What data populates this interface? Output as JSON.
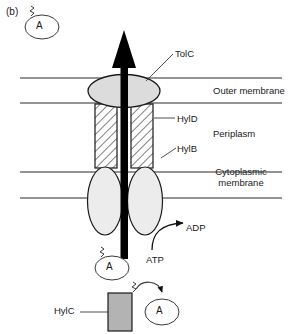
{
  "figure": {
    "panel_letter": "(b)",
    "title_implicit": "Type I secretion system (haemolysin HlyA export)",
    "background_color": "#ffffff",
    "line_color": "#1a1a1a"
  },
  "labels": {
    "tolc": "TolC",
    "hyld": "HylD",
    "hylb": "HylB",
    "hylc": "HylC",
    "outer_membrane": "Outer membrane",
    "periplasm": "Periplasm",
    "cytoplasmic_membrane": "Cytoplasmic membrane",
    "adp": "ADP",
    "atp": "ATP",
    "substrate_letter": "A"
  },
  "components": {
    "tolc": {
      "name": "TolC",
      "shape": "ellipse",
      "fill": "#dcdcdc",
      "stroke": "#1a1a1a",
      "cx": 124,
      "cy": 91,
      "rx": 36,
      "ry": 16,
      "spans": "outer membrane"
    },
    "hyld": {
      "name": "HylD",
      "shape": "hatched-rectangles",
      "fill": "#ffffff",
      "hatch": "diagonal",
      "stroke": "#1a1a1a",
      "left_rect": {
        "x": 95,
        "y": 104,
        "w": 22,
        "h": 64
      },
      "right_rect": {
        "x": 131,
        "y": 104,
        "w": 22,
        "h": 64
      },
      "spans": "periplasm"
    },
    "hylb": {
      "name": "HylB",
      "shape": "ellipses",
      "fill": "#ebebeb",
      "stroke": "#1a1a1a",
      "left_ellipse": {
        "cx": 105,
        "cy": 200,
        "rx": 17,
        "ry": 33
      },
      "right_ellipse": {
        "cx": 145,
        "cy": 200,
        "rx": 17,
        "ry": 33
      },
      "spans": "cytoplasmic membrane"
    },
    "hylc": {
      "name": "HylC",
      "shape": "rectangle",
      "fill": "#b3b3b3",
      "stroke": "#1a1a1a",
      "x": 108,
      "y": 293,
      "w": 24,
      "h": 38
    },
    "export_arrow": {
      "name": "substrate export arrow",
      "color": "#000000",
      "direction": "up",
      "from_y": 258,
      "to_y": 31,
      "x": 124,
      "shaft_width": 7
    }
  },
  "membranes": {
    "lines": [
      {
        "name": "outer-membrane-top",
        "y": 78,
        "x1": 20,
        "x2": 282
      },
      {
        "name": "outer-membrane-bottom",
        "y": 103,
        "x1": 20,
        "x2": 282
      },
      {
        "name": "cytoplasmic-membrane-top",
        "y": 172,
        "x1": 20,
        "x2": 282
      },
      {
        "name": "cytoplasmic-membrane-bottom",
        "y": 198,
        "x1": 20,
        "x2": 282
      }
    ],
    "stroke": "#2a2a2a",
    "stroke_width": 1
  },
  "substrate_molecules": [
    {
      "name": "substrate-top-left",
      "letter": "A",
      "cx": 42,
      "cy": 27,
      "rx": 17,
      "ry": 12,
      "tail": "zigzag"
    },
    {
      "name": "substrate-cytoplasm",
      "letter": "A",
      "cx": 112,
      "cy": 268,
      "rx": 17,
      "ry": 12,
      "tail": "zigzag"
    },
    {
      "name": "substrate-modified",
      "letter": "A",
      "cx": 162,
      "cy": 312,
      "rx": 17,
      "ry": 13,
      "tail": "none"
    }
  ],
  "leaders": [
    {
      "name": "leader-tolc",
      "x1": 145,
      "y1": 81,
      "x2": 172,
      "y2": 53
    },
    {
      "name": "leader-hyld",
      "x1": 154,
      "y1": 118,
      "x2": 174,
      "y2": 118
    },
    {
      "name": "leader-hylb",
      "x1": 160,
      "y1": 160,
      "x2": 175,
      "y2": 149
    },
    {
      "name": "leader-hylc",
      "x1": 78,
      "y1": 311,
      "x2": 108,
      "y2": 311
    }
  ],
  "reaction": {
    "name": "ATP hydrolysis",
    "from": "ATP",
    "to": "ADP",
    "arrow": "curved"
  }
}
